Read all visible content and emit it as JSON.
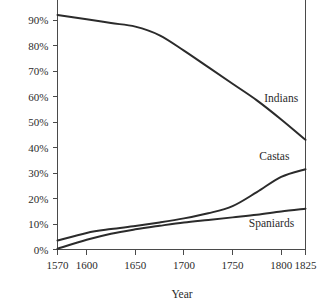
{
  "chart_data": {
    "type": "line",
    "title": "",
    "subtitle": "",
    "xlabel": "Year",
    "ylabel": "",
    "xlim": [
      1570,
      1825
    ],
    "ylim": [
      0,
      95
    ],
    "grid": false,
    "legend_position": "inline-right",
    "x_tick_labels": [
      "1570",
      "1600",
      "1650",
      "1700",
      "1750",
      "1800",
      "1825"
    ],
    "x_ticks": [
      1570,
      1600,
      1650,
      1700,
      1750,
      1800,
      1825
    ],
    "y_tick_labels": [
      "0%",
      "10%",
      "20%",
      "30%",
      "40%",
      "50%",
      "60%",
      "70%",
      "80%",
      "90%"
    ],
    "y_ticks": [
      0,
      10,
      20,
      30,
      40,
      50,
      60,
      70,
      80,
      90
    ],
    "x": [
      1570,
      1600,
      1625,
      1650,
      1675,
      1700,
      1725,
      1750,
      1775,
      1800,
      1825
    ],
    "series": [
      {
        "name": "Indians",
        "label": "Indians",
        "color": "#2b2b2b",
        "values": [
          92.0,
          90.3,
          88.8,
          87.4,
          84.0,
          78.0,
          71.5,
          65.0,
          58.5,
          51.0,
          43.0
        ]
      },
      {
        "name": "Castas",
        "label": "Castas",
        "color": "#2b2b2b",
        "values": [
          3.5,
          6.5,
          8.0,
          9.2,
          10.6,
          12.2,
          14.2,
          17.0,
          22.5,
          28.5,
          31.5
        ]
      },
      {
        "name": "Spaniards",
        "label": "Spaniards",
        "color": "#2b2b2b",
        "values": [
          0.3,
          3.8,
          6.2,
          7.9,
          9.3,
          10.6,
          11.6,
          12.6,
          13.6,
          14.9,
          16.0
        ]
      }
    ],
    "annotations": [
      {
        "text": "Indians",
        "x": 1800,
        "y": 58
      },
      {
        "text": "Castas",
        "x": 1793,
        "y": 35
      },
      {
        "text": "Spaniards",
        "x": 1790,
        "y": 9
      }
    ]
  },
  "axis": {
    "x_title": "Year"
  }
}
